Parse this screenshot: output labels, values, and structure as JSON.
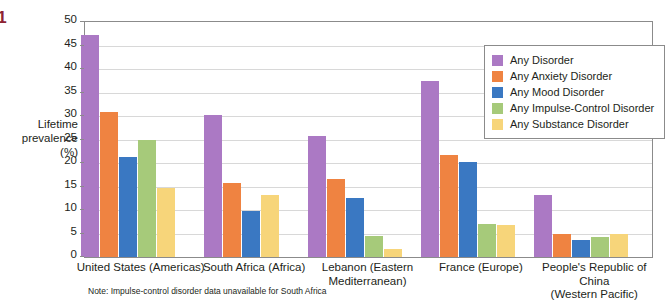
{
  "margin": {
    "figure_number": ".1",
    "heading_fragment": "oss",
    "source_fragment": "sler"
  },
  "axis_title_line1": "Lifetime",
  "axis_title_line2": "prevalence",
  "axis_title_line3": "(%)",
  "footnote": "Note: Impulse-control disorder data unavailable for South Africa",
  "colors": {
    "any_disorder": "#ab79c4",
    "any_anxiety_disorder": "#f08martin",
    "anxiety": "#ef8341",
    "mood": "#3a78c2",
    "impulse": "#a6ca7a",
    "substance": "#f7d57a",
    "axis": "#8b8b8b",
    "grid": "#d8d8d8",
    "figure_number": "#8e2433",
    "heading": "#a83b4a"
  },
  "chart_data": {
    "type": "bar",
    "title": "",
    "subtitle": "",
    "xlabel": "",
    "ylabel": "Lifetime prevalence (%)",
    "ylim": [
      0,
      50
    ],
    "ytick_step": 5,
    "yticks": [
      0,
      5,
      10,
      15,
      20,
      25,
      30,
      35,
      40,
      45,
      50
    ],
    "grid": true,
    "legend_position": "top-right-inside",
    "categories": [
      "United States (Americas)",
      "South Africa (Africa)",
      "Lebanon (Eastern\nMediterranean)",
      "France (Europe)",
      "People's Republic of China\n(Western Pacific)"
    ],
    "category_lines": [
      [
        "United States (Americas)"
      ],
      [
        "South Africa (Africa)"
      ],
      [
        "Lebanon (Eastern",
        "Mediterranean)"
      ],
      [
        "France (Europe)"
      ],
      [
        "People's Republic of China",
        "(Western Pacific)"
      ]
    ],
    "series": [
      {
        "name": "Any Disorder",
        "color": "#ab79c4",
        "values": [
          47.2,
          30.3,
          25.8,
          37.5,
          13.2
        ]
      },
      {
        "name": "Any Anxiety Disorder",
        "color": "#ef8341",
        "values": [
          30.8,
          15.8,
          16.7,
          21.6,
          4.8
        ]
      },
      {
        "name": "Any Mood Disorder",
        "color": "#3a78c2",
        "values": [
          21.3,
          9.8,
          12.6,
          20.3,
          3.6
        ]
      },
      {
        "name": "Any Impulse-Control Disorder",
        "color": "#a6ca7a",
        "values": [
          25.0,
          null,
          4.4,
          7.1,
          4.3
        ]
      },
      {
        "name": "Any Substance Disorder",
        "color": "#f7d57a",
        "values": [
          14.6,
          13.3,
          1.6,
          6.8,
          4.9
        ]
      }
    ]
  }
}
